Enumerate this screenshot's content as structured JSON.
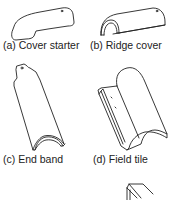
{
  "figures": [
    {
      "id": "a",
      "caption": "(a) Cover starter"
    },
    {
      "id": "b",
      "caption": "(b) Ridge cover"
    },
    {
      "id": "c",
      "caption": "(c) End band"
    },
    {
      "id": "d",
      "caption": "(d) Field tile"
    },
    {
      "id": "e",
      "caption": ""
    }
  ]
}
